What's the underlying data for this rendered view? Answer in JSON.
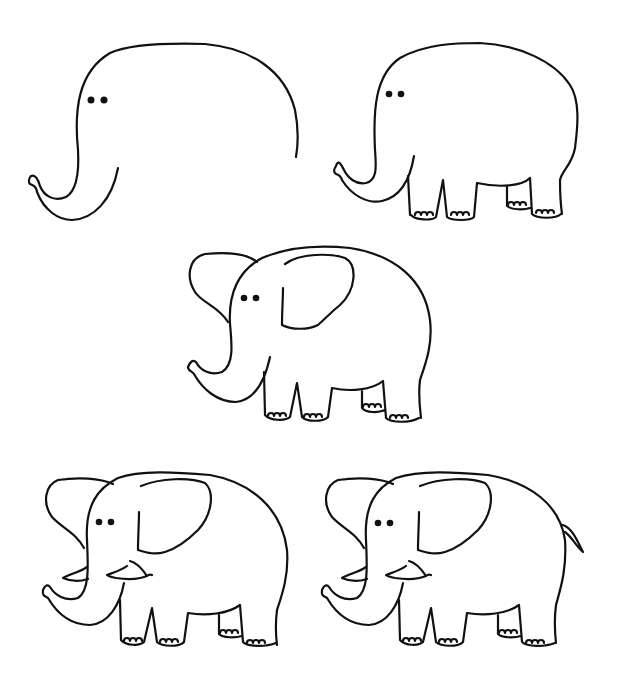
{
  "figure": {
    "background": "#ffffff",
    "line_color": "#111111",
    "steps": [
      {
        "step": 1,
        "label": "Step 1: head and trunk",
        "parts": [
          "head-outline",
          "trunk",
          "eyes"
        ]
      },
      {
        "step": 2,
        "label": "Step 2: body and legs",
        "parts": [
          "head-outline",
          "trunk",
          "eyes",
          "body",
          "legs",
          "toenails"
        ]
      },
      {
        "step": 3,
        "label": "Step 3: ears",
        "parts": [
          "head-outline",
          "trunk",
          "eyes",
          "body",
          "legs",
          "toenails",
          "ears"
        ]
      },
      {
        "step": 4,
        "label": "Step 4: tusks",
        "parts": [
          "head-outline",
          "trunk",
          "eyes",
          "body",
          "legs",
          "toenails",
          "ears",
          "tusks"
        ]
      },
      {
        "step": 5,
        "label": "Step 5: tail",
        "parts": [
          "head-outline",
          "trunk",
          "eyes",
          "body",
          "legs",
          "toenails",
          "ears",
          "tusks",
          "tail"
        ]
      }
    ]
  }
}
